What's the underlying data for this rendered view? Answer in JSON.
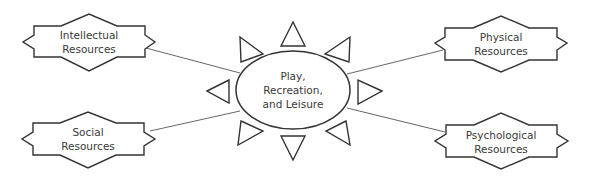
{
  "diagram": {
    "center": {
      "lines": [
        "Play,",
        "Recreation,",
        "and Leisure"
      ]
    },
    "nodes": [
      {
        "id": "intellectual",
        "lines": [
          "Intellectual",
          "Resources"
        ]
      },
      {
        "id": "physical",
        "lines": [
          "Physical",
          "Resources"
        ]
      },
      {
        "id": "social",
        "lines": [
          "Social",
          "Resources"
        ]
      },
      {
        "id": "psychological",
        "lines": [
          "Psychological",
          "Resources"
        ]
      }
    ],
    "colors": {
      "stroke": "#333333",
      "connector": "#555555",
      "text": "#3a3a3a",
      "background": "#ffffff"
    }
  }
}
